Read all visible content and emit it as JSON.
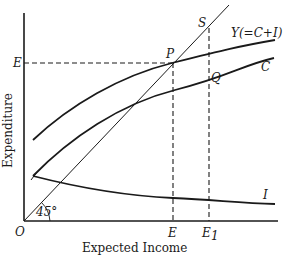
{
  "diagram": {
    "type": "keynesian-cross-expected-income",
    "axes": {
      "xlabel": "Expected Income",
      "ylabel": "Expenditure",
      "origin_label": "O",
      "angle_label": "45°"
    },
    "curves": {
      "total": "Y(=C+I)",
      "consumption": "C",
      "investment": "I"
    },
    "points": {
      "P": "P",
      "S": "S",
      "Q": "Q"
    },
    "ticks": {
      "x_E": "E",
      "x_E1": "E",
      "x_E1_sub": "1",
      "y_E": "E"
    },
    "colors": {
      "ink": "#1a1a1a",
      "background": "#ffffff"
    }
  }
}
